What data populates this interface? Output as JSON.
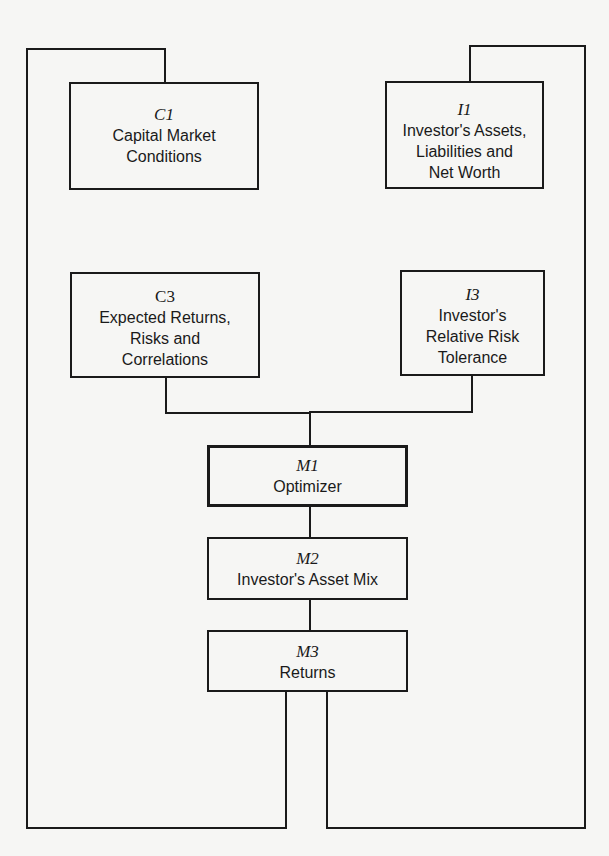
{
  "diagram": {
    "type": "flow-diagram",
    "colors": {
      "background": "#f6f6f4",
      "stroke": "#1a1a1a",
      "text": "#1a1a1a"
    },
    "nodes": [
      {
        "id": "C1",
        "code": "C1",
        "label": "Capital Market\nConditions"
      },
      {
        "id": "I1",
        "code": "I1",
        "label": "Investor's Assets,\nLiabilities and\nNet Worth"
      },
      {
        "id": "C3",
        "code": "C3",
        "label": "Expected Returns,\nRisks and\nCorrelations"
      },
      {
        "id": "I3",
        "code": "I3",
        "label": "Investor's\nRelative Risk\nTolerance"
      },
      {
        "id": "M1",
        "code": "M1",
        "label": "Optimizer"
      },
      {
        "id": "M2",
        "code": "M2",
        "label": "Investor's Asset Mix"
      },
      {
        "id": "M3",
        "code": "M3",
        "label": "Returns"
      }
    ],
    "edges": [
      {
        "from": "C3",
        "to": "M1"
      },
      {
        "from": "I3",
        "to": "M1"
      },
      {
        "from": "M1",
        "to": "M2"
      },
      {
        "from": "M2",
        "to": "M3"
      },
      {
        "from": "M3",
        "to": "C1",
        "route": "feedback-left-loop"
      },
      {
        "from": "M3",
        "to": "I1",
        "route": "feedback-right-loop"
      }
    ]
  }
}
